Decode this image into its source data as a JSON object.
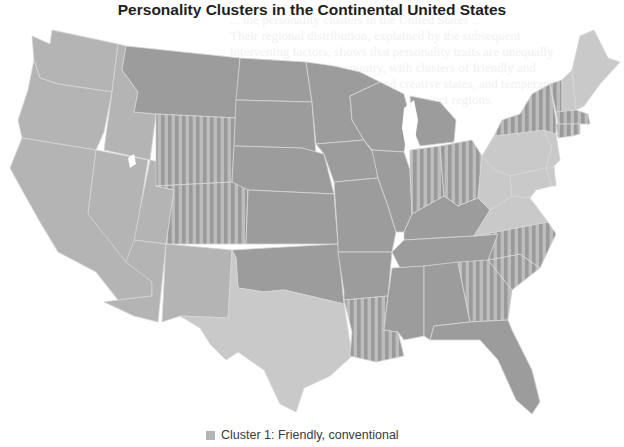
{
  "title": "Personality Clusters in the Continental United States",
  "colors": {
    "cluster1": "#b4b4b4",
    "cluster2": "#9c9c9c",
    "cluster3": "#c9c9c9",
    "stripe_dark": "#9a9a9a",
    "stripe_light": "#bdbdbd",
    "lakes": "#ffffff",
    "title": "#1e1e1e"
  },
  "legend": [
    {
      "label": "Cluster 1: Friendly, conventional",
      "fill": "cluster1"
    }
  ],
  "regions": {
    "cluster1": [
      "WA",
      "OR",
      "CA",
      "NV",
      "ID",
      "UT",
      "AZ",
      "NM"
    ],
    "cluster2": [
      "MT",
      "ND",
      "SD",
      "NE",
      "KS",
      "OK",
      "MN",
      "IA",
      "MO",
      "AR",
      "WI",
      "IL",
      "MI",
      "KY",
      "TN",
      "MS",
      "AL",
      "FL"
    ],
    "cluster3": [
      "TX",
      "WV",
      "VA",
      "PA",
      "NJ",
      "ME",
      "NH",
      "MD",
      "DE"
    ],
    "striped": [
      "WY",
      "CO",
      "LA",
      "OH",
      "IN",
      "NC",
      "SC",
      "GA",
      "NY",
      "VT",
      "MA",
      "CT",
      "RI"
    ]
  },
  "background_text": "... the personality clusters in the United States ...\nTheir regional distribution, explained by the subsequent\nintervening factors, shows that personality traits are unequally\ndistributed across the country, with clusters of friendly and\nconventional states, relaxed and creative states, and temperamental\nand uninhibited states clustered in distinct regions."
}
